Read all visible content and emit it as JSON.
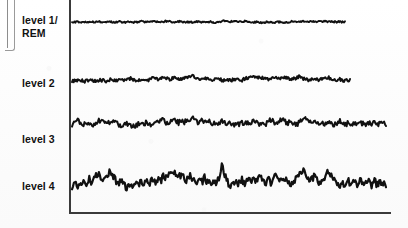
{
  "figure": {
    "title": "",
    "background_color": "#fdfdfd",
    "ink_color": "#111111",
    "axis_color": "#3a3a3a"
  },
  "artifacts": {
    "page_edge_label": "page-edge-fragment"
  },
  "axis": {
    "y_axis_name": "y-axis",
    "x_axis_name": "x-axis",
    "x_start_px": 70,
    "x_end_px": 390,
    "y_top_px": 0,
    "y_baseline_px": 213,
    "ticks": [],
    "tick_labels": [],
    "xlabel": "",
    "ylabel": ""
  },
  "labels": [
    {
      "id": "level1",
      "text": "level 1/\nREM",
      "top_px": 14
    },
    {
      "id": "level2",
      "text": "level 2",
      "top_px": 77
    },
    {
      "id": "level3",
      "text": "level 3",
      "top_px": 133
    },
    {
      "id": "level4",
      "text": "level 4",
      "top_px": 180
    }
  ],
  "chart_data": {
    "type": "line",
    "title": "",
    "subtitle": "",
    "xlabel": "",
    "ylabel": "",
    "xlim": [
      0,
      1
    ],
    "ylim": [
      0,
      1
    ],
    "grid": false,
    "legend": "none",
    "legend_position": "left-labels",
    "x_axis_note": "time (unlabeled)",
    "series": [
      {
        "name": "level 1/REM",
        "label": "level 1/\nREM",
        "baseline_px": 22,
        "x_start_px": 72,
        "x_end_px": 345,
        "amplitude_px": 4.5,
        "values": [
          0.5,
          0.47,
          0.52,
          0.49,
          0.45,
          0.51,
          0.48,
          0.53,
          0.5,
          0.46,
          0.49,
          0.55,
          0.51,
          0.47,
          0.5,
          0.53,
          0.49,
          0.45,
          0.51,
          0.54,
          0.5,
          0.48,
          0.52,
          0.56,
          0.51,
          0.47,
          0.5,
          0.53,
          0.58,
          0.52,
          0.49,
          0.46,
          0.51,
          0.55,
          0.5,
          0.48,
          0.53,
          0.57,
          0.62,
          0.55,
          0.51,
          0.48,
          0.52,
          0.56,
          0.51,
          0.49,
          0.53,
          0.5,
          0.47,
          0.52,
          0.55,
          0.51,
          0.48,
          0.44,
          0.49,
          0.53,
          0.5,
          0.46,
          0.51,
          0.55,
          0.6,
          0.64,
          0.58,
          0.53,
          0.56,
          0.59,
          0.55,
          0.51,
          0.54,
          0.57,
          0.53,
          0.49,
          0.45,
          0.48,
          0.52,
          0.47,
          0.43,
          0.46,
          0.5,
          0.46,
          0.42,
          0.45,
          0.49,
          0.52,
          0.48,
          0.44,
          0.47,
          0.51,
          0.55,
          0.5,
          0.47,
          0.51,
          0.56,
          0.61,
          0.57,
          0.53,
          0.56,
          0.59,
          0.55,
          0.52,
          0.55,
          0.58,
          0.54,
          0.51,
          0.54,
          0.52,
          0.5,
          0.53,
          0.51,
          0.52
        ]
      },
      {
        "name": "level 2",
        "label": "level 2",
        "baseline_px": 80,
        "x_start_px": 72,
        "x_end_px": 350,
        "amplitude_px": 9,
        "values": [
          0.42,
          0.46,
          0.44,
          0.48,
          0.45,
          0.41,
          0.46,
          0.5,
          0.46,
          0.43,
          0.48,
          0.52,
          0.47,
          0.44,
          0.49,
          0.54,
          0.5,
          0.46,
          0.51,
          0.56,
          0.52,
          0.48,
          0.53,
          0.58,
          0.54,
          0.5,
          0.47,
          0.52,
          0.57,
          0.53,
          0.49,
          0.55,
          0.6,
          0.56,
          0.52,
          0.57,
          0.62,
          0.58,
          0.54,
          0.59,
          0.64,
          0.6,
          0.56,
          0.52,
          0.57,
          0.62,
          0.66,
          0.72,
          0.66,
          0.61,
          0.57,
          0.62,
          0.58,
          0.54,
          0.5,
          0.46,
          0.51,
          0.56,
          0.52,
          0.48,
          0.53,
          0.49,
          0.45,
          0.5,
          0.55,
          0.51,
          0.47,
          0.52,
          0.58,
          0.64,
          0.7,
          0.78,
          0.7,
          0.63,
          0.58,
          0.62,
          0.57,
          0.53,
          0.58,
          0.63,
          0.59,
          0.55,
          0.6,
          0.65,
          0.61,
          0.57,
          0.53,
          0.58,
          0.63,
          0.68,
          0.62,
          0.57,
          0.52,
          0.48,
          0.53,
          0.58,
          0.54,
          0.5,
          0.55,
          0.6,
          0.65,
          0.61,
          0.57,
          0.53,
          0.49,
          0.54,
          0.5,
          0.46,
          0.5,
          0.47
        ]
      },
      {
        "name": "level 3",
        "label": "level 3",
        "baseline_px": 124,
        "x_start_px": 72,
        "x_end_px": 386,
        "amplitude_px": 13,
        "values": [
          0.45,
          0.55,
          0.62,
          0.54,
          0.47,
          0.58,
          0.5,
          0.43,
          0.52,
          0.6,
          0.66,
          0.58,
          0.5,
          0.57,
          0.64,
          0.56,
          0.48,
          0.4,
          0.46,
          0.53,
          0.45,
          0.38,
          0.44,
          0.51,
          0.44,
          0.5,
          0.57,
          0.5,
          0.44,
          0.52,
          0.6,
          0.68,
          0.6,
          0.52,
          0.62,
          0.7,
          0.62,
          0.54,
          0.64,
          0.56,
          0.7,
          0.58,
          0.72,
          0.6,
          0.52,
          0.64,
          0.54,
          0.66,
          0.56,
          0.48,
          0.58,
          0.5,
          0.6,
          0.52,
          0.44,
          0.54,
          0.46,
          0.56,
          0.48,
          0.58,
          0.5,
          0.6,
          0.52,
          0.62,
          0.54,
          0.46,
          0.56,
          0.48,
          0.58,
          0.66,
          0.58,
          0.5,
          0.6,
          0.68,
          0.6,
          0.52,
          0.62,
          0.54,
          0.46,
          0.56,
          0.64,
          0.72,
          0.62,
          0.54,
          0.64,
          0.56,
          0.48,
          0.58,
          0.5,
          0.6,
          0.52,
          0.44,
          0.54,
          0.62,
          0.54,
          0.46,
          0.56,
          0.48,
          0.52,
          0.56,
          0.5,
          0.54,
          0.48,
          0.52,
          0.5,
          0.54,
          0.49,
          0.52,
          0.5,
          0.51
        ]
      },
      {
        "name": "level 4",
        "label": "level 4",
        "baseline_px": 182,
        "x_start_px": 72,
        "x_end_px": 386,
        "amplitude_px": 20,
        "values": [
          0.38,
          0.48,
          0.32,
          0.44,
          0.56,
          0.46,
          0.58,
          0.5,
          0.62,
          0.74,
          0.64,
          0.54,
          0.66,
          0.76,
          0.66,
          0.56,
          0.46,
          0.52,
          0.42,
          0.34,
          0.44,
          0.38,
          0.48,
          0.4,
          0.5,
          0.44,
          0.54,
          0.48,
          0.58,
          0.52,
          0.62,
          0.56,
          0.66,
          0.6,
          0.7,
          0.78,
          0.68,
          0.6,
          0.7,
          0.62,
          0.54,
          0.64,
          0.56,
          0.48,
          0.58,
          0.5,
          0.6,
          0.52,
          0.44,
          0.54,
          0.46,
          0.56,
          0.96,
          0.7,
          0.5,
          0.38,
          0.46,
          0.54,
          0.46,
          0.56,
          0.48,
          0.58,
          0.5,
          0.6,
          0.52,
          0.62,
          0.54,
          0.46,
          0.56,
          0.48,
          0.58,
          0.66,
          0.58,
          0.5,
          0.6,
          0.52,
          0.44,
          0.54,
          0.62,
          0.72,
          0.8,
          0.7,
          0.62,
          0.54,
          0.64,
          0.56,
          0.48,
          0.58,
          0.66,
          0.74,
          0.64,
          0.56,
          0.48,
          0.4,
          0.5,
          0.42,
          0.52,
          0.44,
          0.54,
          0.46,
          0.56,
          0.48,
          0.58,
          0.5,
          0.42,
          0.52,
          0.44,
          0.54,
          0.46,
          0.44
        ]
      }
    ]
  }
}
